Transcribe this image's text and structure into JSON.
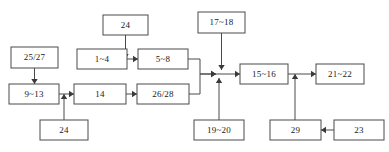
{
  "diagram": {
    "type": "flowchart",
    "orientation": "left-to-right",
    "background_color": "#ffffff",
    "box_fill_color": "#ffffff",
    "box_stroke_color": "#4a4a4a",
    "arrow_color": "#3a3a3a",
    "text_color": "#1a1a1a",
    "nodes": [
      {
        "id": "n25_27",
        "label": "25/27",
        "x": 11,
        "y": 47,
        "w": 47,
        "h": 21
      },
      {
        "id": "n9_13",
        "label": "9~13",
        "x": 9,
        "y": 84,
        "w": 50,
        "h": 20
      },
      {
        "id": "n24a",
        "label": "24",
        "x": 40,
        "y": 120,
        "w": 48,
        "h": 20
      },
      {
        "id": "n1_4",
        "label": "1~4",
        "x": 77,
        "y": 49,
        "w": 50,
        "h": 20
      },
      {
        "id": "n14",
        "label": "14",
        "x": 74,
        "y": 84,
        "w": 52,
        "h": 20
      },
      {
        "id": "n24b",
        "label": "24",
        "x": 103,
        "y": 15,
        "w": 45,
        "h": 20
      },
      {
        "id": "n5_8",
        "label": "5~8",
        "x": 138,
        "y": 49,
        "w": 50,
        "h": 20
      },
      {
        "id": "n26_28",
        "label": "26/28",
        "x": 137,
        "y": 84,
        "w": 52,
        "h": 20
      },
      {
        "id": "n17_18",
        "label": "17~18",
        "x": 198,
        "y": 12,
        "w": 47,
        "h": 21
      },
      {
        "id": "n19_20",
        "label": "19~20",
        "x": 194,
        "y": 120,
        "w": 50,
        "h": 20
      },
      {
        "id": "n15_16",
        "label": "15~16",
        "x": 240,
        "y": 64,
        "w": 48,
        "h": 20
      },
      {
        "id": "n21_22",
        "label": "21~22",
        "x": 316,
        "y": 64,
        "w": 48,
        "h": 20
      },
      {
        "id": "n29",
        "label": "29",
        "x": 270,
        "y": 120,
        "w": 51,
        "h": 20
      },
      {
        "id": "n23",
        "label": "23",
        "x": 334,
        "y": 120,
        "w": 50,
        "h": 20
      }
    ],
    "edges": [
      {
        "id": "e1",
        "from": "n25_27",
        "to": "n9_13",
        "points": "34.5,68 34.5,84",
        "arrow": "down",
        "arrow_at": "34.5,84"
      },
      {
        "id": "e2",
        "from": "n9_13",
        "to": "n14",
        "points": "59,94 74,94",
        "arrow": "right",
        "arrow_at": "74,94"
      },
      {
        "id": "e3",
        "from": "n24a",
        "to": "n14",
        "points": "64,120 64,94",
        "arrow": "up",
        "arrow_at": "64,94"
      },
      {
        "id": "e4",
        "from": "n1_4",
        "to": "n5_8",
        "points": "127,59 138,59",
        "arrow": "right",
        "arrow_at": "138,59"
      },
      {
        "id": "e5",
        "from": "n24b",
        "to": "n5_8",
        "points": "125.5,35 125.5,59",
        "arrow": "down",
        "arrow_at": "125.5,59"
      },
      {
        "id": "e6",
        "from": "n14",
        "to": "n26_28",
        "points": "126,94 137,94",
        "arrow": "right",
        "arrow_at": "137,94"
      },
      {
        "id": "e7",
        "from": "n5_8",
        "to": "n15_16",
        "points": "188,59 200,59 200,74 216,74",
        "arrow": "right",
        "arrow_at": "216,74"
      },
      {
        "id": "e8",
        "from": "n26_28",
        "to": "n15_16",
        "points": "189,94 200,94 200,74 216,74",
        "arrow": "right",
        "arrow_at": "216,74"
      },
      {
        "id": "e9",
        "from": "n17_18",
        "to": "n15_16",
        "points": "221.5,33 221.5,70",
        "arrow": "down",
        "arrow_at": "221.5,70"
      },
      {
        "id": "e10",
        "from": "n19_20",
        "to": "n15_16",
        "points": "219,120 219,78",
        "arrow": "up",
        "arrow_at": "219,78"
      },
      {
        "id": "e11",
        "from": "junction",
        "to": "n15_16",
        "points": "216,74 240,74",
        "arrow": "right",
        "arrow_at": "240,74"
      },
      {
        "id": "e12",
        "from": "n15_16",
        "to": "n21_22",
        "points": "288,74 316,74",
        "arrow": "right",
        "arrow_at": "316,74"
      },
      {
        "id": "e13",
        "from": "n29",
        "to": "n21_22",
        "points": "295,120 295,74",
        "arrow": "up",
        "arrow_at": "295,74"
      },
      {
        "id": "e14",
        "from": "n23",
        "to": "n29",
        "points": "334,130 321,130",
        "arrow": "left",
        "arrow_at": "321,130"
      }
    ]
  }
}
